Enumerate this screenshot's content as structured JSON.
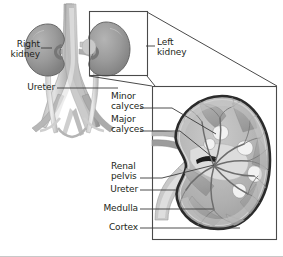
{
  "figure": {
    "type": "anatomical-diagram",
    "palette": {
      "background": "#ffffff",
      "outline": "#231f20",
      "text": "#231f20",
      "kidney_fill_dark": "#8f8f8f",
      "kidney_fill_mid": "#a8a8a8",
      "kidney_fill_light": "#c4c4c4",
      "vessel_light": "#d6d6d6",
      "vessel_mid": "#b0b0b0",
      "vessel_dark": "#8a8a8a",
      "capsule_stroke": "#2b2b2b",
      "cortex_fill": "#b9b9b9",
      "medulla_fill": "#a0a0a0",
      "pelvis_fill": "#d9d9d9",
      "leader_line": "#3a3a3a",
      "frame_line": "#4a4a4a"
    }
  },
  "overview": {
    "name": "urinary-system-overview",
    "labels": {
      "right_kidney": "Right\nkidney",
      "left_kidney": "Left\nkidney",
      "ureter": "Ureter"
    }
  },
  "detail": {
    "name": "kidney-cross-section",
    "labels": {
      "minor_calyces": "Minor\ncalyces",
      "major_calyces": "Major\ncalyces",
      "renal_pelvis": "Renal\npelvis",
      "ureter": "Ureter",
      "medulla": "Medulla",
      "cortex": "Cortex"
    }
  }
}
